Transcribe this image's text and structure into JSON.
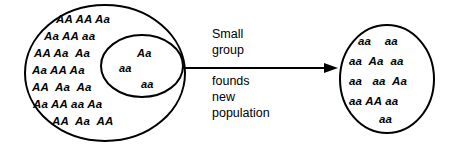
{
  "figure": {
    "type": "founder-effect-diagram",
    "background_color": "#ffffff",
    "stroke_color": "#000000"
  },
  "source_population": {
    "label": "original-population-ellipse",
    "rows": [
      "AA AA Aa",
      "Aa AA aa",
      "AA Aa  Aa",
      "Aa AA Aa",
      "AA  Aa  Aa",
      "Aa AA aa Aa",
      "AA  Aa  AA"
    ]
  },
  "founder_group": {
    "label": "founder-subset-ellipse",
    "items": [
      "Aa",
      "aa",
      "aa"
    ]
  },
  "arrow_caption": {
    "above": [
      "Small",
      "group"
    ],
    "below": [
      "founds",
      "new",
      "population"
    ]
  },
  "new_population": {
    "label": "new-population-circle",
    "rows": [
      "aa    aa",
      "aa  Aa  aa",
      "aa   aa  Aa",
      "aa AA aa",
      "aa"
    ]
  }
}
